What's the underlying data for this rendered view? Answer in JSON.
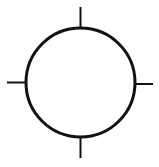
{
  "diagram": {
    "title": "",
    "shape": "circle-with-crosshair-ticks",
    "stroke_color": "#111111",
    "background": "#ffffff",
    "circle": {
      "cx": 80.5,
      "cy": 82.5,
      "r": 54.5,
      "stroke_width": 3
    },
    "ticks": [
      {
        "name": "top",
        "x1": 80.5,
        "y1": 7,
        "x2": 80.5,
        "y2": 27
      },
      {
        "name": "bottom",
        "x1": 80.5,
        "y1": 138,
        "x2": 80.5,
        "y2": 158
      },
      {
        "name": "left",
        "x1": 7,
        "y1": 82.5,
        "x2": 26,
        "y2": 82.5
      },
      {
        "name": "right",
        "x1": 135,
        "y1": 84,
        "x2": 153,
        "y2": 84
      }
    ],
    "tick_stroke_width": 2
  }
}
